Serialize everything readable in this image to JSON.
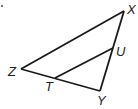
{
  "diagram": {
    "title": "",
    "type": "triangle",
    "stroke_color": "#1a1a1a",
    "vertices": {
      "X": {
        "label": "X",
        "x": 124,
        "y": 11
      },
      "Z": {
        "label": "Z",
        "x": 21,
        "y": 69
      },
      "Y": {
        "label": "Y",
        "x": 100,
        "y": 91
      },
      "U": {
        "label": "U",
        "x": 113,
        "y": 48
      },
      "T": {
        "label": "T",
        "x": 55,
        "y": 78
      }
    },
    "segments": [
      {
        "from": "X",
        "to": "Z"
      },
      {
        "from": "Z",
        "to": "Y"
      },
      {
        "from": "Y",
        "to": "X"
      },
      {
        "from": "T",
        "to": "U"
      }
    ],
    "labels": {
      "X": "X",
      "Z": "Z",
      "Y": "Y",
      "U": "U",
      "T": "T"
    }
  }
}
